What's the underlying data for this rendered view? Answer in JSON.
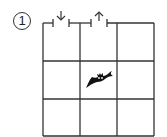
{
  "puzzle": {
    "number_label": "1",
    "grid": {
      "rows": 3,
      "cols": 3
    },
    "entrances": [
      {
        "col": 0,
        "side": "top",
        "direction": "down",
        "icon": "down-arrow-icon",
        "glyph": "↓"
      },
      {
        "col": 1,
        "side": "top",
        "direction": "up",
        "icon": "up-arrow-icon",
        "glyph": "↑"
      }
    ],
    "creature": {
      "row": 1,
      "col": 1,
      "icon": "bat-icon"
    },
    "colors": {
      "line": "#333333",
      "background": "#ffffff",
      "creature": "#111111"
    }
  }
}
